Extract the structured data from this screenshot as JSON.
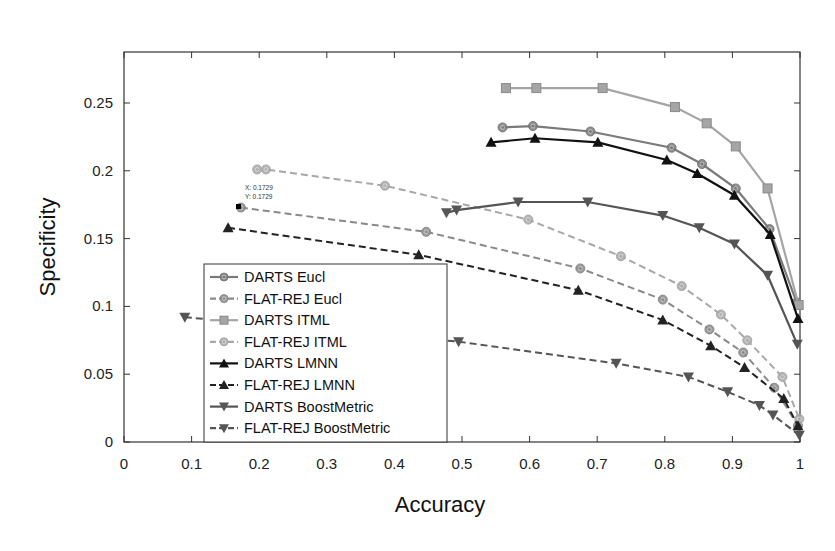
{
  "chart_data": {
    "type": "line",
    "title": "",
    "xlabel": "Accuracy",
    "ylabel": "Specificity",
    "xlim": [
      0,
      1
    ],
    "ylim": [
      0,
      0.28
    ],
    "grid": false,
    "legend_position": "lower-left (inside)",
    "x_ticks": [
      "0",
      "0.1",
      "0.2",
      "0.3",
      "0.4",
      "0.5",
      "0.6",
      "0.7",
      "0.8",
      "0.9",
      "1"
    ],
    "y_ticks": [
      "0",
      "0.05",
      "0.1",
      "0.15",
      "0.2",
      "0.25"
    ],
    "annotations": [
      {
        "type": "datatip",
        "x_label": "X: 0.1729",
        "y_label": "Y: 0.1729",
        "at": [
          0.1729,
          0.1729
        ]
      }
    ],
    "series": [
      {
        "name": "DARTS Eucl",
        "style": "solid",
        "marker": "circle",
        "color": "#7a7a7a",
        "x": [
          0.56,
          0.605,
          0.69,
          0.81,
          0.855,
          0.905,
          0.955,
          0.995
        ],
        "y": [
          0.232,
          0.233,
          0.229,
          0.217,
          0.205,
          0.187,
          0.157,
          0.103
        ]
      },
      {
        "name": "FLAT-REJ Eucl",
        "style": "dashed",
        "marker": "circle",
        "color": "#8a8a8a",
        "x": [
          0.1729,
          0.447,
          0.675,
          0.797,
          0.866,
          0.916,
          0.962,
          0.997
        ],
        "y": [
          0.1729,
          0.155,
          0.128,
          0.105,
          0.083,
          0.066,
          0.04,
          0.012
        ]
      },
      {
        "name": "DARTS ITML",
        "style": "solid",
        "marker": "square",
        "color": "#a5a5a5",
        "x": [
          0.565,
          0.61,
          0.708,
          0.815,
          0.862,
          0.905,
          0.952,
          0.998
        ],
        "y": [
          0.261,
          0.261,
          0.261,
          0.247,
          0.235,
          0.218,
          0.187,
          0.101
        ]
      },
      {
        "name": "FLAT-REJ ITML",
        "style": "dashed",
        "marker": "circle",
        "color": "#a8a8a8",
        "x": [
          0.197,
          0.21,
          0.386,
          0.598,
          0.735,
          0.825,
          0.883,
          0.922,
          0.974,
          0.999
        ],
        "y": [
          0.201,
          0.201,
          0.189,
          0.164,
          0.137,
          0.115,
          0.094,
          0.075,
          0.048,
          0.017
        ]
      },
      {
        "name": "DARTS LMNN",
        "style": "solid",
        "marker": "triangle-up",
        "color": "#111111",
        "x": [
          0.543,
          0.608,
          0.701,
          0.803,
          0.848,
          0.903,
          0.956,
          0.997
        ],
        "y": [
          0.221,
          0.224,
          0.221,
          0.208,
          0.198,
          0.182,
          0.153,
          0.091
        ]
      },
      {
        "name": "FLAT-REJ LMNN",
        "style": "dashed",
        "marker": "triangle-up",
        "color": "#222222",
        "x": [
          0.154,
          0.436,
          0.672,
          0.797,
          0.868,
          0.918,
          0.976,
          0.997
        ],
        "y": [
          0.158,
          0.138,
          0.112,
          0.09,
          0.071,
          0.055,
          0.032,
          0.012
        ]
      },
      {
        "name": "DARTS BoostMetric",
        "style": "solid",
        "marker": "triangle-down",
        "color": "#555555",
        "x": [
          0.477,
          0.492,
          0.583,
          0.686,
          0.797,
          0.851,
          0.903,
          0.952,
          0.996
        ],
        "y": [
          0.169,
          0.171,
          0.177,
          0.177,
          0.167,
          0.158,
          0.146,
          0.123,
          0.072
        ]
      },
      {
        "name": "FLAT-REJ BoostMetric",
        "style": "dashed",
        "marker": "triangle-down",
        "color": "#555555",
        "x": [
          0.09,
          0.495,
          0.728,
          0.835,
          0.893,
          0.94,
          0.96,
          0.999
        ],
        "y": [
          0.092,
          0.074,
          0.058,
          0.048,
          0.037,
          0.027,
          0.02,
          0.005
        ]
      }
    ]
  }
}
